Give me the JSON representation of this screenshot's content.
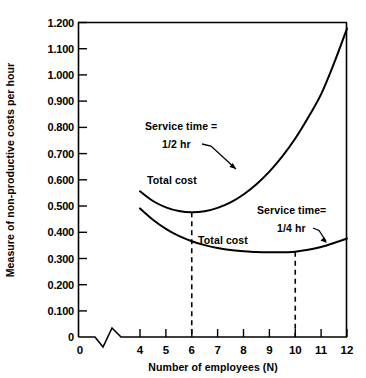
{
  "chart_data": {
    "type": "line",
    "title": "",
    "xlabel": "Number of employees (N)",
    "ylabel": "Measure of non-productive costs per hour",
    "xlim": [
      4,
      12
    ],
    "ylim": [
      0,
      1.2
    ],
    "grid": false,
    "legend_position": "inline-annotations",
    "x_ticks": [
      "0",
      "4",
      "5",
      "6",
      "7",
      "8",
      "9",
      "10",
      "11",
      "12"
    ],
    "x_tick_values": [
      0,
      4,
      5,
      6,
      7,
      8,
      9,
      10,
      11,
      12
    ],
    "x_axis_break": true,
    "y_ticks": [
      "0",
      "0.100",
      "0.200",
      "0.300",
      "0.400",
      "0.500",
      "0.600",
      "0.700",
      "0.800",
      "0.900",
      "1.000",
      "1.100",
      "1.200"
    ],
    "y_tick_values": [
      0,
      0.1,
      0.2,
      0.3,
      0.4,
      0.5,
      0.6,
      0.7,
      0.8,
      0.9,
      1.0,
      1.1,
      1.2
    ],
    "series": [
      {
        "name": "Service time = 1/2 hr",
        "curve_label": "Total cost",
        "x": [
          4,
          4.5,
          5,
          5.5,
          6,
          6.5,
          7,
          7.5,
          8,
          8.5,
          9,
          9.5,
          10,
          10.5,
          11,
          11.5,
          12
        ],
        "values": [
          0.555,
          0.518,
          0.494,
          0.48,
          0.475,
          0.479,
          0.492,
          0.513,
          0.543,
          0.582,
          0.63,
          0.688,
          0.756,
          0.836,
          0.925,
          1.043,
          1.175
        ],
        "minimum_x": 6,
        "minimum_y": 0.475
      },
      {
        "name": "Service time= 1/4 hr",
        "curve_label": "Total cost",
        "x": [
          4,
          4.5,
          5,
          5.5,
          6,
          6.5,
          7,
          7.5,
          8,
          8.5,
          9,
          9.5,
          10,
          10.5,
          11,
          11.5,
          12
        ],
        "values": [
          0.49,
          0.447,
          0.412,
          0.385,
          0.365,
          0.35,
          0.339,
          0.331,
          0.327,
          0.324,
          0.323,
          0.323,
          0.325,
          0.332,
          0.343,
          0.358,
          0.375
        ],
        "minimum_x": 10,
        "minimum_y": 0.325
      }
    ],
    "annotations": [
      {
        "id": "upper-service-time",
        "lines": [
          "Service time =",
          "1/2 hr"
        ],
        "points_to_series": "Service time = 1/2 hr"
      },
      {
        "id": "lower-service-time",
        "lines": [
          "Service time=",
          "1/4 hr"
        ],
        "points_to_series": "Service time= 1/4 hr"
      },
      {
        "id": "upper-total-cost",
        "lines": [
          "Total cost"
        ]
      },
      {
        "id": "lower-total-cost",
        "lines": [
          "Total cost"
        ]
      }
    ],
    "reference_lines": [
      {
        "id": "optimum-n-6",
        "x": 6,
        "style": "dashed",
        "from_y": 0.0,
        "to_y": 0.475
      },
      {
        "id": "optimum-n-10",
        "x": 10,
        "style": "dashed",
        "from_y": 0.0,
        "to_y": 0.325
      }
    ]
  },
  "axis": {
    "y_title": "Measure of non-productive costs per hour",
    "x_title": "Number of employees (N)"
  },
  "y_tick_labels": {
    "t0": "0",
    "t1": "0.100",
    "t2": "0.200",
    "t3": "0.300",
    "t4": "0.400",
    "t5": "0.500",
    "t6": "0.600",
    "t7": "0.700",
    "t8": "0.800",
    "t9": "0.900",
    "t10": "1.000",
    "t11": "1.100",
    "t12": "1.200"
  },
  "x_tick_labels": {
    "origin": "0",
    "n4": "4",
    "n5": "5",
    "n6": "6",
    "n7": "7",
    "n8": "8",
    "n9": "9",
    "n10": "10",
    "n11": "11",
    "n12": "12"
  },
  "labels": {
    "upper_service_line1": "Service time =",
    "upper_service_line2": "1/2 hr",
    "upper_total_cost": "Total cost",
    "lower_service_line1": "Service time=",
    "lower_service_line2": "1/4 hr",
    "lower_total_cost": "Total cost"
  }
}
